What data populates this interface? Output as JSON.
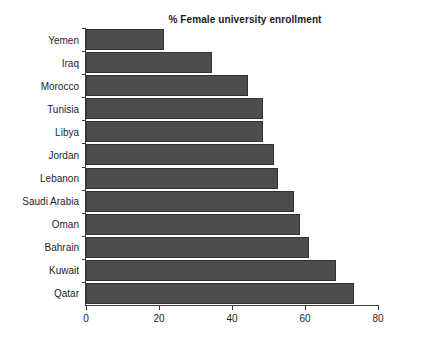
{
  "chart_data": {
    "type": "bar",
    "orientation": "horizontal",
    "title": "% Female university enrollment",
    "xlabel": "",
    "ylabel": "",
    "categories": [
      "Yemen",
      "Iraq",
      "Morocco",
      "Tunisia",
      "Libya",
      "Jordan",
      "Lebanon",
      "Saudi Arabia",
      "Oman",
      "Bahrain",
      "Kuwait",
      "Qatar"
    ],
    "values": [
      21.5,
      34.5,
      44.5,
      48.5,
      48.5,
      51.5,
      52.5,
      57,
      58.5,
      61,
      68.5,
      73.5
    ],
    "xlim": [
      0,
      80
    ],
    "xticks": [
      0,
      20,
      40,
      60,
      80
    ],
    "xtick_labels": [
      "0",
      "20",
      "40",
      "60",
      "80"
    ],
    "grid": false,
    "legend": false,
    "bar_color": "#4d4d4d",
    "bar_edge_color": "#333333",
    "axis_color": "#3a3a3a",
    "text_color": "#231f20"
  }
}
